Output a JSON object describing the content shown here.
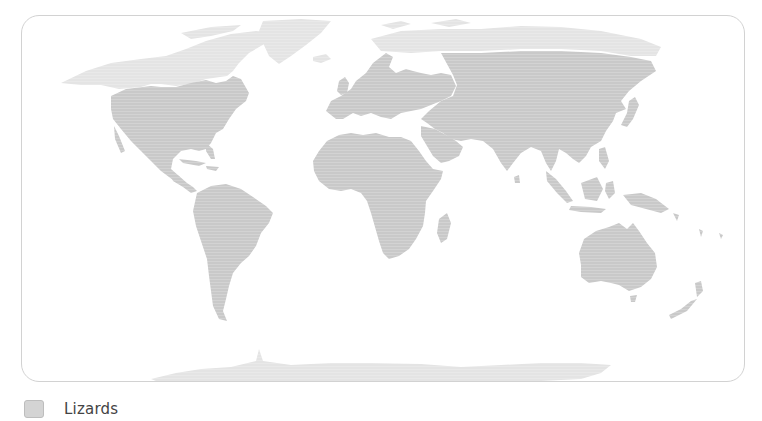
{
  "map": {
    "title": "",
    "projection": "world equirectangular-style",
    "colors": {
      "range_fill": "#c9c9c9",
      "other_land_fill": "#e4e4e4",
      "ocean": "#ffffff",
      "frame_border": "#d2d2d2"
    },
    "regions_in_range": [
      "North America (south of ~50°N)",
      "Central America",
      "Caribbean",
      "South America",
      "Europe",
      "Africa",
      "Madagascar",
      "Middle East",
      "Central Asia",
      "South Asia",
      "East Asia",
      "Southeast Asia",
      "Indonesia",
      "New Guinea",
      "Australia",
      "New Zealand"
    ],
    "regions_outside_range": [
      "Alaska & northern Canada",
      "Greenland",
      "Arctic islands",
      "Northern Siberia",
      "Antarctica"
    ]
  },
  "legend": {
    "items": [
      {
        "label": "Lizards",
        "color": "#d4d4d4",
        "icon": "legend-swatch"
      }
    ]
  }
}
